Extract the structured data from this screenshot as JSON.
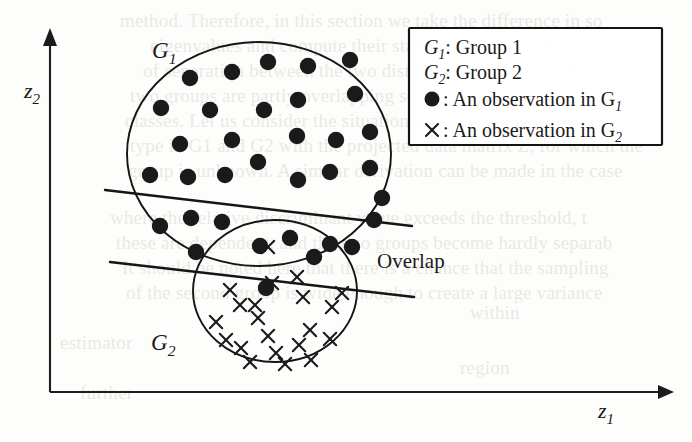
{
  "figure": {
    "type": "scatter",
    "title": "",
    "axes": {
      "x_label": "z",
      "x_label_sub": "1",
      "y_label": "z",
      "y_label_sub": "2"
    },
    "annotations": {
      "group1_label": "G",
      "group1_label_sub": "1",
      "group2_label": "G",
      "group2_label_sub": "2",
      "overlap_label": "Overlap"
    },
    "legend": {
      "rows": [
        {
          "marker": "none",
          "text_pre": "G",
          "text_sub": "1",
          "text_post": ": Group 1"
        },
        {
          "marker": "none",
          "text_pre": "G",
          "text_sub": "2",
          "text_post": ": Group 2"
        },
        {
          "marker": "dot-marker",
          "text_pre": "",
          "text_sub": "",
          "text_post": ": An observation in G",
          "text_tail_sub": "1"
        },
        {
          "marker": "cross-marker",
          "text_pre": "",
          "text_sub": "",
          "text_post": ": An observation in G",
          "text_tail_sub": "2"
        }
      ]
    },
    "colors": {
      "ink": "#1a1a1a",
      "paper": "#fdfdfb",
      "ghost_text": "#6b6256"
    }
  },
  "chart_data": {
    "type": "scatter",
    "title": "",
    "xlabel": "z1",
    "ylabel": "z2",
    "xlim": [
      0,
      692
    ],
    "ylim": [
      0,
      442
    ],
    "grid": false,
    "legend_position": "top-right",
    "annotations": [
      "G1",
      "G2",
      "Overlap"
    ],
    "shapes": [
      {
        "name": "G1",
        "kind": "ellipse",
        "cx": 259,
        "cy": 154,
        "rx": 132,
        "ry": 112,
        "rotation": 0
      },
      {
        "name": "G2",
        "kind": "ellipse",
        "cx": 275,
        "cy": 291,
        "rx": 82,
        "ry": 71,
        "rotation": 0
      },
      {
        "name": "boundary-upper",
        "kind": "line",
        "x1": 105,
        "y1": 190,
        "x2": 412,
        "y2": 226
      },
      {
        "name": "boundary-lower",
        "kind": "line",
        "x1": 110,
        "y1": 262,
        "x2": 414,
        "y2": 297
      }
    ],
    "series": [
      {
        "name": "An observation in G1",
        "marker": "filled-circle",
        "count": 34,
        "points": [
          [
            190,
            78
          ],
          [
            232,
            72
          ],
          [
            268,
            62
          ],
          [
            308,
            66
          ],
          [
            350,
            60
          ],
          [
            161,
            108
          ],
          [
            210,
            110
          ],
          [
            264,
            110
          ],
          [
            298,
            100
          ],
          [
            355,
            94
          ],
          [
            180,
            144
          ],
          [
            232,
            140
          ],
          [
            297,
            136
          ],
          [
            336,
            140
          ],
          [
            370,
            132
          ],
          [
            150,
            175
          ],
          [
            188,
            177
          ],
          [
            225,
            175
          ],
          [
            258,
            162
          ],
          [
            298,
            180
          ],
          [
            330,
            172
          ],
          [
            370,
            168
          ],
          [
            160,
            226
          ],
          [
            191,
            218
          ],
          [
            222,
            222
          ],
          [
            260,
            246
          ],
          [
            290,
            238
          ],
          [
            314,
            257
          ],
          [
            330,
            244
          ],
          [
            352,
            247
          ],
          [
            374,
            220
          ],
          [
            382,
            198
          ],
          [
            266,
            288
          ],
          [
            196,
            252
          ]
        ]
      },
      {
        "name": "An observation in G2",
        "marker": "cross",
        "count": 21,
        "points": [
          [
            268,
            247
          ],
          [
            272,
            283
          ],
          [
            297,
            277
          ],
          [
            303,
            297
          ],
          [
            230,
            290
          ],
          [
            255,
            305
          ],
          [
            332,
            307
          ],
          [
            342,
            293
          ],
          [
            258,
            318
          ],
          [
            268,
            336
          ],
          [
            276,
            353
          ],
          [
            299,
            345
          ],
          [
            310,
            330
          ],
          [
            216,
            322
          ],
          [
            226,
            340
          ],
          [
            241,
            348
          ],
          [
            250,
            362
          ],
          [
            285,
            364
          ],
          [
            311,
            360
          ],
          [
            330,
            339
          ],
          [
            240,
            305
          ]
        ]
      }
    ]
  },
  "background_text": {
    "lines": [
      {
        "x": 120,
        "y": 8,
        "text": "method. Therefore, in this section we take the difference in so"
      },
      {
        "x": 150,
        "y": 33,
        "text": "eigenvalues and compute their statistical significance"
      },
      {
        "x": 143,
        "y": 58,
        "text": "of separation between the two distributions. Figure 1 show"
      },
      {
        "x": 130,
        "y": 83,
        "text": "two groups are partly overlapping so that the mislabel is some"
      },
      {
        "x": 125,
        "y": 108,
        "text": "classes. Let us consider the situation where the observations in"
      },
      {
        "x": 130,
        "y": 133,
        "text": "type in G1 and G2 with the projected data matrix Z, for which the"
      },
      {
        "x": 128,
        "y": 158,
        "text": "group is unknown. A similar derivation can be made in the case"
      },
      {
        "x": 110,
        "y": 205,
        "text": "where the relative discriminant value exceeds the threshold, t"
      },
      {
        "x": 116,
        "y": 230,
        "text": "these are dependent, and the two groups become hardly separab"
      },
      {
        "x": 122,
        "y": 255,
        "text": "It should be noted here that there is a chance that the sampling"
      },
      {
        "x": 126,
        "y": 280,
        "text": "of the second group is wide enough to create a large variance"
      },
      {
        "x": 470,
        "y": 300,
        "text": "within"
      },
      {
        "x": 60,
        "y": 330,
        "text": "estimator"
      },
      {
        "x": 460,
        "y": 355,
        "text": "region"
      },
      {
        "x": 80,
        "y": 380,
        "text": "further"
      }
    ]
  }
}
